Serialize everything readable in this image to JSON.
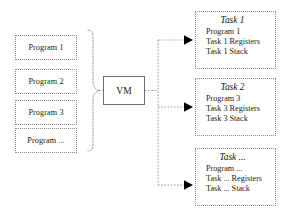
{
  "diagram": {
    "background_color": "#ffffff",
    "line_color": "#8a8a8a",
    "arrow_color": "#000000",
    "box_border_color": "#8a8a8a",
    "vm_border_color": "#6e6e6e",
    "text_color": "#1a1a1a"
  },
  "programs": {
    "group_label": "programs",
    "items": [
      {
        "label": "Program 1"
      },
      {
        "label": "Program 2"
      },
      {
        "label": "Program 3"
      },
      {
        "label": "Program ..."
      }
    ]
  },
  "vm": {
    "label": "VM"
  },
  "tasks": [
    {
      "title": "Task 1",
      "lines": [
        "Program 1",
        "Task 1 Registers",
        "Task 1 Stack"
      ]
    },
    {
      "title": "Task 2",
      "lines": [
        "Program 3",
        "Task 3 Registers",
        "Task 3 Stack"
      ]
    },
    {
      "title": "Task ...",
      "lines": [
        "Program ...",
        "Task ... Registers",
        "Task ... Stack"
      ]
    }
  ],
  "connectors": {
    "brace_label": "programs-to-vm-brace",
    "trunk_label": "vm-output-trunk",
    "branch_labels": [
      "arrow-to-task-1",
      "arrow-to-task-2",
      "arrow-to-task-3"
    ]
  }
}
